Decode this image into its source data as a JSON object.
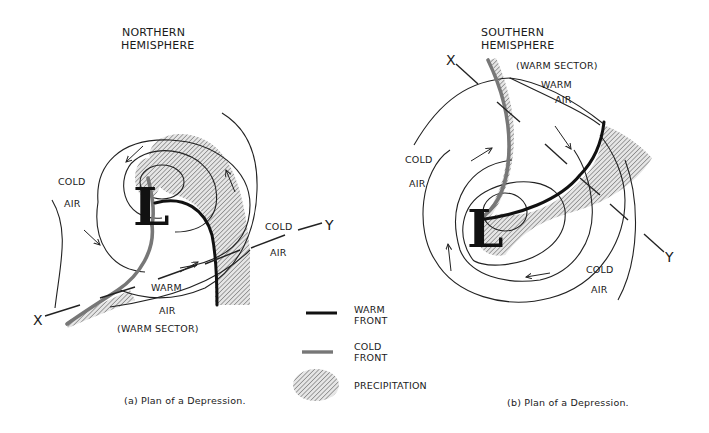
{
  "figure": {
    "panels": [
      {
        "id": "a",
        "title_line1": "NORTHERN",
        "title_line2": "HEMISPHERE",
        "center_label": "L",
        "labels": {
          "cold_air_1_line1": "COLD",
          "cold_air_1_line2": "AIR",
          "cold_air_2_line1": "COLD",
          "cold_air_2_line2": "AIR",
          "warm_air_line1": "WARM",
          "warm_air_line2": "AIR",
          "warm_sector": "(WARM SECTOR)",
          "section_start": "X",
          "section_end": "Y"
        },
        "caption": "(a)  Plan of a Depression."
      },
      {
        "id": "b",
        "title_line1": "SOUTHERN",
        "title_line2": "HEMISPHERE",
        "center_label": "L",
        "labels": {
          "warm_sector": "(WARM SECTOR)",
          "warm_air_line1": "WARM",
          "warm_air_line2": "AIR",
          "cold_air_1_line1": "COLD",
          "cold_air_1_line2": "AIR",
          "cold_air_2_line1": "COLD",
          "cold_air_2_line2": "AIR",
          "section_start": "X",
          "section_end": "Y"
        },
        "caption": "(b)  Plan of a Depression."
      }
    ],
    "legend": {
      "items": [
        {
          "symbol": "warm-front-line",
          "label_line1": "WARM",
          "label_line2": "FRONT",
          "color": "#111111"
        },
        {
          "symbol": "cold-front-line",
          "label_line1": "COLD",
          "label_line2": "FRONT",
          "color": "#777777"
        },
        {
          "symbol": "hatched-ellipse",
          "label_line1": "PRECIPITATION",
          "label_line2": ""
        }
      ]
    },
    "colors": {
      "ink": "#1a1a1a",
      "warm_front": "#111111",
      "cold_front": "#777777",
      "hatch": "#555555",
      "background": "#ffffff"
    }
  }
}
